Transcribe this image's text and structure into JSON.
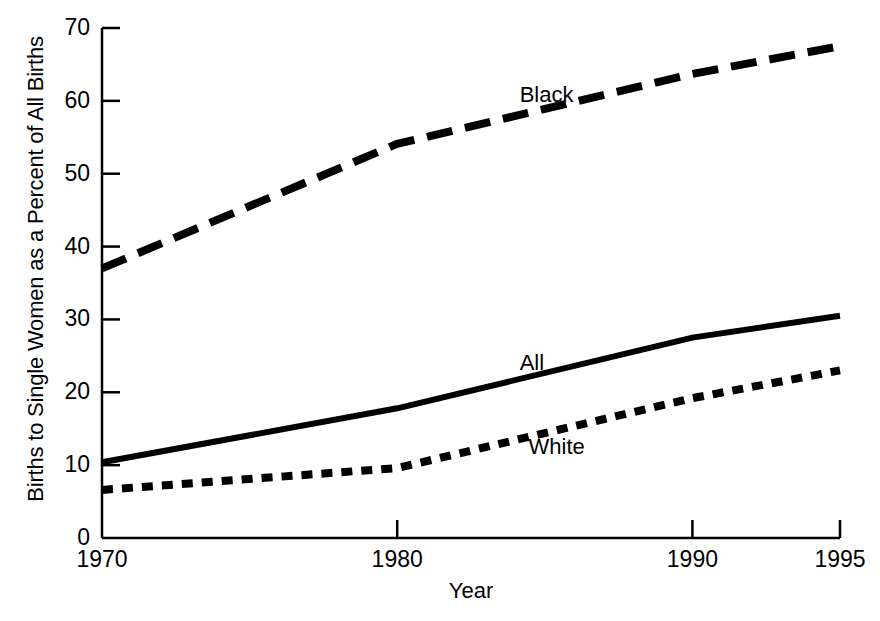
{
  "chart_data": {
    "type": "line",
    "title": "",
    "xlabel": "Year",
    "ylabel": "Births to Single Women as a Percent of All Births",
    "x": [
      1970,
      1980,
      1990,
      1995
    ],
    "xlim": [
      1970,
      1995
    ],
    "ylim": [
      0,
      70
    ],
    "xticks": [
      "1970",
      "1980",
      "1990",
      "1995"
    ],
    "yticks": [
      "0",
      "10",
      "20",
      "30",
      "40",
      "50",
      "60",
      "70"
    ],
    "grid": false,
    "legend": "inline-labels",
    "series": [
      {
        "name": "Black",
        "style": "long-dash",
        "color": "#000000",
        "values": [
          37.0,
          54.1,
          63.7,
          67.5
        ],
        "label": "Black",
        "label_x": 1985.3,
        "label_y": 60.5
      },
      {
        "name": "All",
        "style": "solid",
        "color": "#000000",
        "values": [
          10.4,
          17.8,
          27.5,
          30.5
        ],
        "label": "All",
        "label_x": 1985.3,
        "label_y": 23.8
      },
      {
        "name": "White",
        "style": "short-dash",
        "color": "#000000",
        "values": [
          6.6,
          9.6,
          19.2,
          23.0
        ],
        "label": "White",
        "label_x": 1985.6,
        "label_y": 12.2
      }
    ]
  },
  "axes": {
    "y_axis_name": "y-axis",
    "x_axis_name": "x-axis"
  }
}
